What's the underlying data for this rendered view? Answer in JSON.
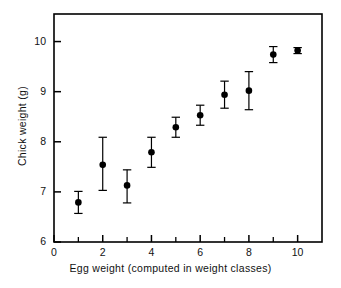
{
  "chart_data": {
    "type": "scatter",
    "title": "",
    "xlabel": "Egg weight (computed in weight classes)",
    "ylabel": "Chick weight (g)",
    "xlim": [
      0,
      11
    ],
    "ylim": [
      6,
      10.55
    ],
    "grid": false,
    "legend": null,
    "x_ticks_major": [
      0,
      2,
      4,
      6,
      8,
      10
    ],
    "x_tick_labels": [
      "0",
      "2",
      "4",
      "6",
      "8",
      "10"
    ],
    "x_ticks_minor": [
      1,
      3,
      5,
      7,
      9
    ],
    "y_ticks_major": [
      6,
      7,
      8,
      9,
      10
    ],
    "y_tick_labels": [
      "6",
      "7",
      "8",
      "9",
      "10"
    ],
    "marker": "filled-circle",
    "error_bars": "vertical",
    "x": [
      1,
      2,
      3,
      4,
      5,
      6,
      7,
      8,
      9,
      10
    ],
    "values": [
      6.79,
      7.54,
      7.13,
      7.79,
      8.29,
      8.53,
      8.94,
      9.02,
      9.74,
      9.82
    ],
    "error_low": [
      0.22,
      0.51,
      0.35,
      0.3,
      0.2,
      0.2,
      0.27,
      0.38,
      0.16,
      0.06
    ],
    "error_high": [
      0.22,
      0.55,
      0.31,
      0.3,
      0.2,
      0.2,
      0.27,
      0.38,
      0.16,
      0.06
    ],
    "points": [
      {
        "x": 1,
        "y": 6.79,
        "low": 6.57,
        "high": 7.01
      },
      {
        "x": 2,
        "y": 7.54,
        "low": 7.03,
        "high": 8.09
      },
      {
        "x": 3,
        "y": 7.13,
        "low": 6.78,
        "high": 7.44
      },
      {
        "x": 4,
        "y": 7.79,
        "low": 7.49,
        "high": 8.09
      },
      {
        "x": 5,
        "y": 8.29,
        "low": 8.09,
        "high": 8.49
      },
      {
        "x": 6,
        "y": 8.53,
        "low": 8.33,
        "high": 8.73
      },
      {
        "x": 7,
        "y": 8.94,
        "low": 8.67,
        "high": 9.21
      },
      {
        "x": 8,
        "y": 9.02,
        "low": 8.64,
        "high": 9.4
      },
      {
        "x": 9,
        "y": 9.74,
        "low": 9.58,
        "high": 9.9
      },
      {
        "x": 10,
        "y": 9.82,
        "low": 9.76,
        "high": 9.88
      }
    ],
    "colors": {
      "marker": "#000000",
      "error_bar": "#000000",
      "axis": "#000000",
      "background": "#ffffff"
    }
  }
}
